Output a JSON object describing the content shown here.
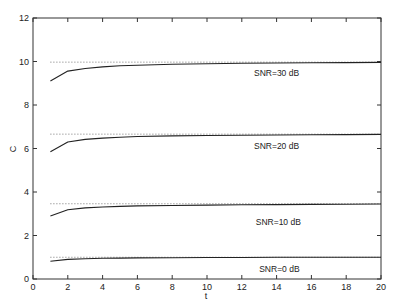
{
  "chart_data": {
    "type": "line",
    "title": "",
    "xlabel": "t",
    "ylabel": "C",
    "xlim": [
      0,
      20
    ],
    "ylim": [
      0,
      12
    ],
    "xticks": [
      0,
      2,
      4,
      6,
      8,
      10,
      12,
      14,
      16,
      18,
      20
    ],
    "yticks": [
      0,
      2,
      4,
      6,
      8,
      10,
      12
    ],
    "grid": false,
    "legend": "none (inline curve labels)",
    "x": [
      1,
      2,
      3,
      4,
      5,
      6,
      8,
      10,
      12,
      14,
      16,
      18,
      20
    ],
    "series": [
      {
        "name": "SNR=30 dB",
        "style": "solid",
        "values": [
          9.1,
          9.56,
          9.68,
          9.75,
          9.8,
          9.83,
          9.87,
          9.9,
          9.92,
          9.93,
          9.94,
          9.95,
          9.96
        ],
        "asymptote": 9.97,
        "label_at": [
          12.7,
          9.45
        ]
      },
      {
        "name": "SNR=20 dB",
        "style": "solid",
        "values": [
          5.85,
          6.3,
          6.42,
          6.48,
          6.52,
          6.55,
          6.58,
          6.6,
          6.61,
          6.62,
          6.63,
          6.64,
          6.65
        ],
        "asymptote": 6.66,
        "label_at": [
          12.7,
          6.1
        ]
      },
      {
        "name": "SNR=10 dB",
        "style": "solid",
        "values": [
          2.9,
          3.18,
          3.27,
          3.31,
          3.34,
          3.36,
          3.38,
          3.4,
          3.41,
          3.42,
          3.43,
          3.44,
          3.45
        ],
        "asymptote": 3.46,
        "label_at": [
          12.8,
          2.6
        ]
      },
      {
        "name": "SNR=0 dB",
        "style": "solid",
        "values": [
          0.82,
          0.9,
          0.93,
          0.95,
          0.96,
          0.97,
          0.98,
          0.99,
          0.99,
          1.0,
          1.0,
          1.0,
          1.0
        ],
        "asymptote": 1.0,
        "label_at": [
          13.0,
          0.45
        ]
      }
    ],
    "asymptote_style": "dotted",
    "asymptote_x_range": [
      1,
      20
    ]
  }
}
